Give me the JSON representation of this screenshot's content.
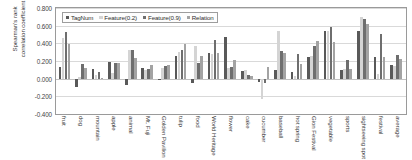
{
  "chart_data": {
    "type": "bar",
    "title": "",
    "xlabel": "",
    "ylabel": "Spearman's rank\ncorrelation coefficient",
    "ylim": [
      -0.4,
      0.8
    ],
    "ytick_labels": [
      "0.800",
      "0.600",
      "0.400",
      "0.200",
      "0.000",
      "-0.200",
      "-0.400"
    ],
    "ytick_values": [
      0.8,
      0.6,
      0.4,
      0.2,
      0.0,
      -0.2,
      -0.4
    ],
    "grid": true,
    "legend_position": "top-left-inside",
    "categories": [
      "fruit",
      "dog",
      "mountain",
      "apple",
      "animal",
      "Mt. Fuji",
      "Golden Pavilion",
      "tulip",
      "food",
      "World Heritage",
      "flower",
      "cake",
      "cucumber",
      "baseball",
      "hot spring",
      "Gion Festival",
      "vegetable",
      "sports",
      "sightseeing spot",
      "festival",
      "average"
    ],
    "series": [
      {
        "name": "TagNum",
        "color": "#595959",
        "values": [
          0.135,
          -0.09,
          0.105,
          0.19,
          -0.075,
          0.125,
          -0.02,
          0.26,
          -0.045,
          0.295,
          0.475,
          0.085,
          -0.04,
          0.095,
          0.08,
          0.25,
          0.535,
          0.1,
          0.54,
          0.24,
          0.155
        ]
      },
      {
        "name": "Feature(0.2)",
        "color": "#d4d4d4",
        "values": [
          0.455,
          0.02,
          0.045,
          0.06,
          0.325,
          0.1,
          0.125,
          0.3,
          0.37,
          0.28,
          0.125,
          0.095,
          -0.23,
          0.535,
          0.035,
          0.26,
          0.535,
          0.105,
          0.695,
          0.05,
          0.145
        ]
      },
      {
        "name": "Feature(0.9)",
        "color": "#6e6e6e",
        "values": [
          0.525,
          0.17,
          0.075,
          0.175,
          0.33,
          0.115,
          0.145,
          0.33,
          0.175,
          0.435,
          0.13,
          0.045,
          -0.05,
          0.315,
          0.28,
          0.375,
          0.585,
          0.215,
          0.68,
          0.505,
          0.265
        ]
      },
      {
        "name": "Relation",
        "color": "#a3a3a3",
        "values": [
          0.39,
          0.12,
          0.01,
          0.18,
          0.235,
          0.15,
          0.155,
          0.39,
          0.26,
          0.285,
          0.215,
          0.03,
          0.135,
          0.29,
          0.165,
          0.43,
          0.415,
          0.105,
          0.62,
          0.25,
          0.22
        ]
      }
    ]
  },
  "legend": {
    "items": [
      {
        "label": "TagNum"
      },
      {
        "label": "Feature(0.2)"
      },
      {
        "label": "Feature(0.9)"
      },
      {
        "label": "Relation"
      }
    ]
  }
}
